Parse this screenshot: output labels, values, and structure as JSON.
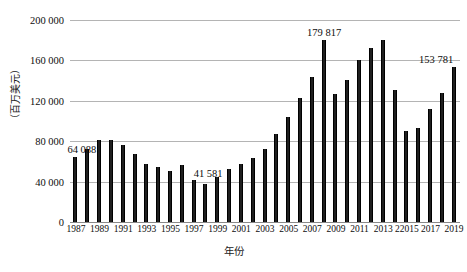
{
  "chart_data": {
    "type": "bar",
    "title": "",
    "subtitle": "",
    "xlabel": "年份",
    "ylabel": "（百万美元）",
    "ylim": [
      0,
      200000
    ],
    "ytick_step": 40000,
    "ytick_labels": [
      "200 000",
      "160 000",
      "120 000",
      "80 000",
      "40 000",
      "0"
    ],
    "ytick_values": [
      200000,
      160000,
      120000,
      80000,
      40000,
      0
    ],
    "grid": true,
    "legend": false,
    "bar_color": "#1f1f1f",
    "grid_color": "#b4b4b4",
    "xtick_labels": [
      "1987",
      "1989",
      "1991",
      "1993",
      "1995",
      "1997",
      "1999",
      "2001",
      "2003",
      "2005",
      "2007",
      "2009",
      "2011",
      "2013",
      "22015",
      "2017",
      "2019"
    ],
    "xtick_years": [
      1987,
      1989,
      1991,
      1993,
      1995,
      1997,
      1999,
      2001,
      2003,
      2005,
      2007,
      2009,
      2011,
      2013,
      2015,
      2017,
      2019
    ],
    "categories": [
      1987,
      1988,
      1989,
      1990,
      1991,
      1992,
      1993,
      1994,
      1995,
      1996,
      1997,
      1998,
      1999,
      2000,
      2001,
      2002,
      2003,
      2004,
      2005,
      2006,
      2007,
      2008,
      2009,
      2010,
      2011,
      2012,
      2013,
      2014,
      2015,
      2016,
      2017,
      2018,
      2019
    ],
    "values": [
      64088,
      72000,
      81500,
      81000,
      76000,
      67500,
      57000,
      54500,
      50500,
      56500,
      41581,
      38000,
      45000,
      52500,
      57000,
      63500,
      72500,
      87000,
      104000,
      122500,
      144000,
      179817,
      127000,
      141000,
      160000,
      172000,
      180000,
      131000,
      90500,
      93000,
      112000,
      128000,
      153781
    ],
    "annotations": [
      {
        "label": "64 088",
        "year": 1987,
        "value": 64088
      },
      {
        "label": "41 581",
        "year": 1997,
        "value": 41581
      },
      {
        "label": "179 817",
        "year": 2008,
        "value": 179817
      },
      {
        "label": "153 781",
        "year": 2019,
        "value": 153781
      }
    ]
  }
}
